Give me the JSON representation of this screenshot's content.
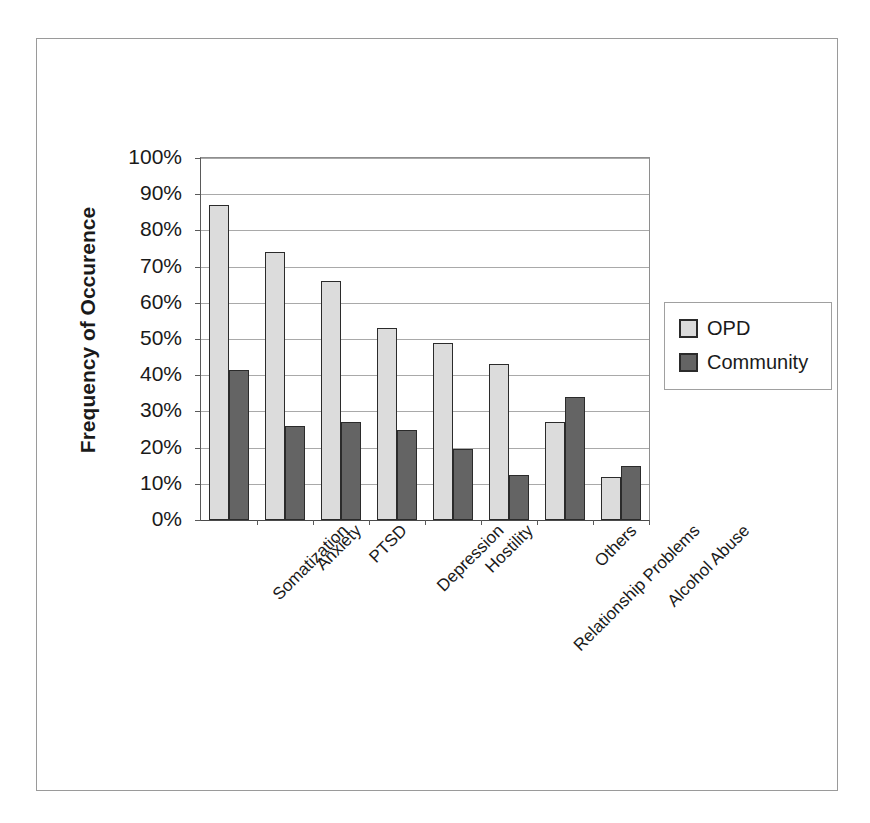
{
  "chart_data": {
    "type": "bar",
    "title": "",
    "subtitle": "",
    "xlabel": "",
    "ylabel": "Frequency of Occurence",
    "ylim": [
      0,
      100
    ],
    "ytick_labels": [
      "100%",
      "90%",
      "80%",
      "70%",
      "60%",
      "50%",
      "40%",
      "30%",
      "20%",
      "10%",
      "0%"
    ],
    "ytick_values": [
      100,
      90,
      80,
      70,
      60,
      50,
      40,
      30,
      20,
      10,
      0
    ],
    "grid": true,
    "legend_position": "right",
    "categories": [
      "Somatization",
      "Anxiety",
      "PTSD",
      "Depression",
      "Hostility",
      "Relationship Problems",
      "Others",
      "Alcohol Abuse"
    ],
    "series": [
      {
        "name": "OPD",
        "color": "#dcdcdc",
        "values": [
          87,
          74,
          66,
          53,
          49,
          43,
          27,
          12
        ]
      },
      {
        "name": "Community",
        "color": "#646464",
        "values": [
          41.5,
          26,
          27,
          25,
          19.5,
          12.5,
          34,
          15
        ]
      }
    ]
  },
  "legend": {
    "entries": [
      {
        "label": "OPD",
        "swatch": "opd-swatch"
      },
      {
        "label": "Community",
        "swatch": "community-swatch"
      }
    ]
  },
  "colors": {
    "series_opd": "#dcdcdc",
    "series_community": "#646464",
    "bar_border": "#2b2b2b",
    "gridline": "#a9a9a9",
    "axis": "#5a5a5a",
    "frame": "#9a9a9a",
    "text": "#1a1a1a",
    "background": "#ffffff"
  }
}
